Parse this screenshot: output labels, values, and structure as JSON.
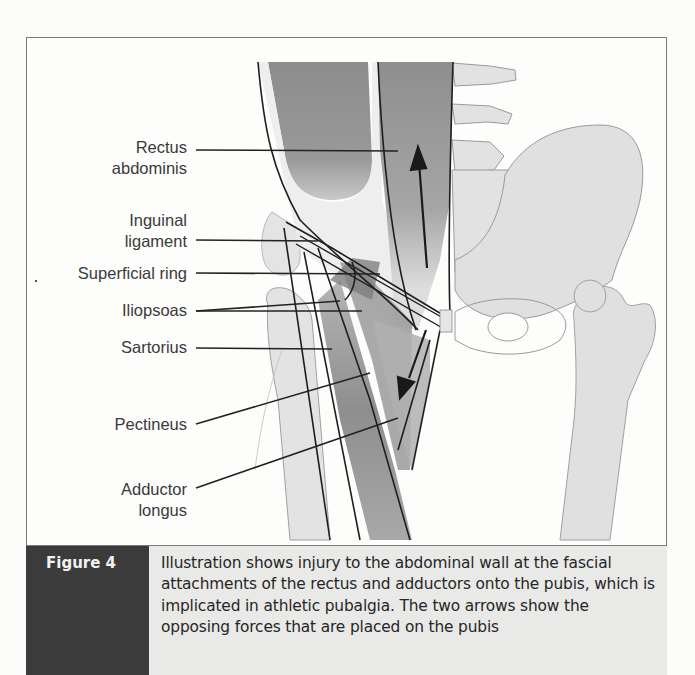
{
  "figure": {
    "labels": [
      {
        "id": "rectus-abdominis",
        "lines": [
          "Rectus",
          "abdominis"
        ]
      },
      {
        "id": "inguinal-ligament",
        "lines": [
          "Inguinal",
          "ligament"
        ]
      },
      {
        "id": "superficial-ring",
        "lines": [
          "Superficial ring"
        ]
      },
      {
        "id": "iliopsoas",
        "lines": [
          "Iliopsoas"
        ]
      },
      {
        "id": "sartorius",
        "lines": [
          "Sartorius"
        ]
      },
      {
        "id": "pectineus",
        "lines": [
          "Pectineus"
        ]
      },
      {
        "id": "adductor-longus",
        "lines": [
          "Adductor",
          "longus"
        ]
      }
    ],
    "arrows": [
      {
        "name": "upward-force-arrow",
        "direction": "up",
        "acts_on": "rectus abdominis"
      },
      {
        "name": "downward-force-arrow",
        "direction": "down",
        "acts_on": "adductors"
      }
    ]
  },
  "caption": {
    "label": "Figure 4",
    "text": "Illustration shows injury to the abdominal wall at the fascial attachments of the rectus and adductors onto the pubis, which is implicated in athletic pubalgia. The two arrows show the opposing forces that are placed on the pubis"
  },
  "colors": {
    "caption_label_bg": "#3b3b3b",
    "caption_text_bg": "#e9e9e8",
    "muscle_dark": "#8a8a8a",
    "bone_light": "#dcdcdc"
  }
}
